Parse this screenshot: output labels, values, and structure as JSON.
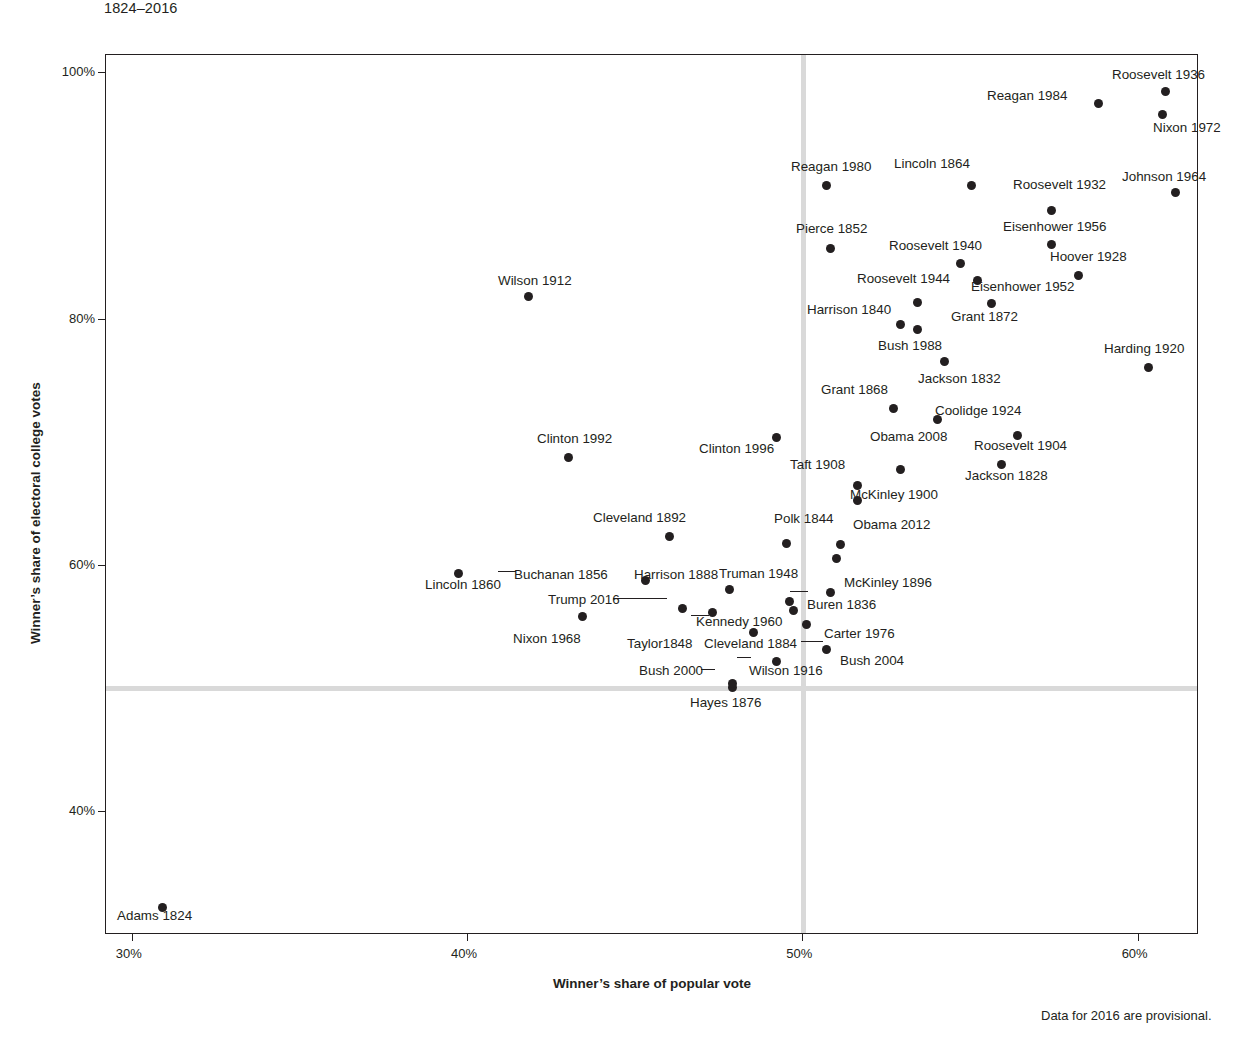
{
  "subtitle": "1824–2016",
  "axis": {
    "x_title": "Winner’s share of popular vote",
    "y_title": "Winner’s share of electoral college votes",
    "x_ticks": [
      "30%",
      "40%",
      "50%",
      "60%"
    ],
    "y_ticks": [
      "100%",
      "80%",
      "60%",
      "40%"
    ]
  },
  "footnote": "Data for 2016 are provisional.",
  "colors": {
    "point": "#231f20",
    "grid": "#d9d9d9",
    "axis": "#231f20",
    "background": "#ffffff"
  },
  "chart_data": {
    "type": "scatter",
    "title": "",
    "subtitle": "1824–2016",
    "xlabel": "Winner’s share of popular vote",
    "ylabel": "Winner’s share of electoral college votes",
    "xlim": [
      29.2,
      61.8
    ],
    "ylim": [
      30.0,
      101.5
    ],
    "grid": false,
    "reference_lines": {
      "x": 50,
      "y": 50
    },
    "note": "Data for 2016 are provisional.",
    "points": [
      {
        "label": "Adams 1824",
        "x": 30.9,
        "y": 32.2
      },
      {
        "label": "Jackson 1828",
        "x": 55.9,
        "y": 68.2
      },
      {
        "label": "Jackson 1832",
        "x": 54.2,
        "y": 76.6
      },
      {
        "label": "Buren 1836",
        "x": 50.8,
        "y": 57.8
      },
      {
        "label": "Harrison 1840",
        "x": 52.9,
        "y": 79.6
      },
      {
        "label": "Polk 1844",
        "x": 49.5,
        "y": 61.8
      },
      {
        "label": "Taylor 1848",
        "x": 47.3,
        "y": 56.2
      },
      {
        "label": "Pierce 1852",
        "x": 50.8,
        "y": 85.8
      },
      {
        "label": "Buchanan 1856",
        "x": 45.3,
        "y": 58.8
      },
      {
        "label": "Lincoln 1860",
        "x": 39.7,
        "y": 59.4
      },
      {
        "label": "Lincoln 1864",
        "x": 55.0,
        "y": 90.9
      },
      {
        "label": "Grant 1868",
        "x": 52.7,
        "y": 72.8
      },
      {
        "label": "Grant 1872",
        "x": 55.6,
        "y": 81.3
      },
      {
        "label": "Hayes 1876",
        "x": 47.9,
        "y": 50.1
      },
      {
        "label": "Cleveland 1884",
        "x": 48.5,
        "y": 54.6
      },
      {
        "label": "Harrison 1888",
        "x": 47.8,
        "y": 58.1
      },
      {
        "label": "Cleveland 1892",
        "x": 46.0,
        "y": 62.4
      },
      {
        "label": "McKinley 1896",
        "x": 51.0,
        "y": 60.6
      },
      {
        "label": "McKinley 1900",
        "x": 51.6,
        "y": 65.3
      },
      {
        "label": "Roosevelt 1904",
        "x": 56.4,
        "y": 70.6
      },
      {
        "label": "Taft 1908",
        "x": 51.6,
        "y": 66.5
      },
      {
        "label": "Wilson 1912",
        "x": 41.8,
        "y": 81.9
      },
      {
        "label": "Wilson 1916",
        "x": 49.2,
        "y": 52.2
      },
      {
        "label": "Harding 1920",
        "x": 60.3,
        "y": 76.1
      },
      {
        "label": "Coolidge 1924",
        "x": 54.0,
        "y": 71.9
      },
      {
        "label": "Hoover 1928",
        "x": 58.2,
        "y": 83.6
      },
      {
        "label": "Roosevelt 1932",
        "x": 57.4,
        "y": 88.9
      },
      {
        "label": "Roosevelt 1936",
        "x": 60.8,
        "y": 98.5
      },
      {
        "label": "Roosevelt 1940",
        "x": 54.7,
        "y": 84.6
      },
      {
        "label": "Roosevelt 1944",
        "x": 53.4,
        "y": 81.4
      },
      {
        "label": "Truman 1948",
        "x": 49.6,
        "y": 57.1
      },
      {
        "label": "Eisenhower 1952",
        "x": 55.2,
        "y": 83.2
      },
      {
        "label": "Eisenhower 1956",
        "x": 57.4,
        "y": 86.1
      },
      {
        "label": "Kennedy 1960",
        "x": 49.7,
        "y": 56.4
      },
      {
        "label": "Johnson 1964",
        "x": 61.1,
        "y": 90.3
      },
      {
        "label": "Nixon 1968",
        "x": 43.4,
        "y": 55.9
      },
      {
        "label": "Nixon 1972",
        "x": 60.7,
        "y": 96.7
      },
      {
        "label": "Carter 1976",
        "x": 50.1,
        "y": 55.2
      },
      {
        "label": "Reagan 1980",
        "x": 50.7,
        "y": 90.9
      },
      {
        "label": "Reagan 1984",
        "x": 58.8,
        "y": 97.6
      },
      {
        "label": "Bush 1988",
        "x": 53.4,
        "y": 79.2
      },
      {
        "label": "Clinton 1992",
        "x": 43.0,
        "y": 68.8
      },
      {
        "label": "Clinton 1996",
        "x": 49.2,
        "y": 70.4
      },
      {
        "label": "Bush 2000",
        "x": 47.9,
        "y": 50.4
      },
      {
        "label": "Bush 2004",
        "x": 50.7,
        "y": 53.2
      },
      {
        "label": "Obama 2008",
        "x": 52.9,
        "y": 67.8
      },
      {
        "label": "Obama 2012",
        "x": 51.1,
        "y": 61.7
      },
      {
        "label": "Trump 2016",
        "x": 46.4,
        "y": 56.5
      }
    ]
  },
  "labels": [
    {
      "name": "Adams 1824",
      "text": "Adams 1824",
      "lx": 116,
      "ly": 908,
      "leader": null
    },
    {
      "name": "Jackson 1828",
      "text": "Jackson 1828",
      "lx": 964,
      "ly": 468,
      "leader": null
    },
    {
      "name": "Jackson 1832",
      "text": "Jackson 1832",
      "lx": 917,
      "ly": 371,
      "leader": null
    },
    {
      "name": "Buren 1836",
      "text": "Buren 1836",
      "lx": 806,
      "ly": 597,
      "leader": {
        "x": 789,
        "y": 590,
        "w": 18
      }
    },
    {
      "name": "Harrison 1840",
      "text": "Harrison 1840",
      "lx": 806,
      "ly": 302,
      "leader": null
    },
    {
      "name": "Polk 1844",
      "text": "Polk 1844",
      "lx": 773,
      "ly": 511,
      "leader": null
    },
    {
      "name": "Taylor 1848",
      "text": "Taylor1848",
      "lx": 626,
      "ly": 636,
      "leader": {
        "x": 690,
        "y": 614,
        "w": 18
      }
    },
    {
      "name": "Pierce 1852",
      "text": "Pierce 1852",
      "lx": 795,
      "ly": 221,
      "leader": null
    },
    {
      "name": "Buchanan 1856",
      "text": "Buchanan 1856",
      "lx": 513,
      "ly": 567,
      "leader": null
    },
    {
      "name": "Lincoln 1860",
      "text": "Lincoln 1860",
      "lx": 424,
      "ly": 577,
      "leader": {
        "x": 497,
        "y": 570,
        "w": 18
      }
    },
    {
      "name": "Lincoln 1864",
      "text": "Lincoln 1864",
      "lx": 893,
      "ly": 156,
      "leader": null
    },
    {
      "name": "Grant 1868",
      "text": "Grant 1868",
      "lx": 820,
      "ly": 382,
      "leader": null
    },
    {
      "name": "Grant 1872",
      "text": "Grant 1872",
      "lx": 950,
      "ly": 309,
      "leader": null
    },
    {
      "name": "Hayes 1876",
      "text": "Hayes 1876",
      "lx": 689,
      "ly": 695,
      "leader": null
    },
    {
      "name": "Cleveland 1884",
      "text": "Cleveland 1884",
      "lx": 703,
      "ly": 636,
      "leader": null
    },
    {
      "name": "Harrison 1888",
      "text": "Harrison 1888",
      "lx": 633,
      "ly": 567,
      "leader": null
    },
    {
      "name": "Cleveland 1892",
      "text": "Cleveland 1892",
      "lx": 592,
      "ly": 510,
      "leader": null
    },
    {
      "name": "McKinley 1896",
      "text": "McKinley 1896",
      "lx": 843,
      "ly": 575,
      "leader": null
    },
    {
      "name": "McKinley 1900",
      "text": "McKinley 1900",
      "lx": 849,
      "ly": 487,
      "leader": null
    },
    {
      "name": "Roosevelt 1904",
      "text": "Roosevelt 1904",
      "lx": 973,
      "ly": 438,
      "leader": null
    },
    {
      "name": "Taft 1908",
      "text": "Taft 1908",
      "lx": 789,
      "ly": 457,
      "leader": null
    },
    {
      "name": "Wilson 1912",
      "text": "Wilson 1912",
      "lx": 497,
      "ly": 273,
      "leader": null
    },
    {
      "name": "Wilson 1916",
      "text": "Wilson 1916",
      "lx": 748,
      "ly": 663,
      "leader": {
        "x": 736,
        "y": 656,
        "w": 14
      }
    },
    {
      "name": "Harding 1920",
      "text": "Harding 1920",
      "lx": 1103,
      "ly": 341,
      "leader": null
    },
    {
      "name": "Coolidge 1924",
      "text": "Coolidge 1924",
      "lx": 934,
      "ly": 403,
      "leader": null
    },
    {
      "name": "Hoover 1928",
      "text": "Hoover 1928",
      "lx": 1049,
      "ly": 249,
      "leader": null
    },
    {
      "name": "Roosevelt 1932",
      "text": "Roosevelt 1932",
      "lx": 1012,
      "ly": 177,
      "leader": null
    },
    {
      "name": "Roosevelt 1936",
      "text": "Roosevelt 1936",
      "lx": 1111,
      "ly": 67,
      "leader": null
    },
    {
      "name": "Roosevelt 1940",
      "text": "Roosevelt 1940",
      "lx": 888,
      "ly": 238,
      "leader": null
    },
    {
      "name": "Roosevelt 1944",
      "text": "Roosevelt 1944",
      "lx": 856,
      "ly": 271,
      "leader": null
    },
    {
      "name": "Truman 1948",
      "text": "Truman 1948",
      "lx": 718,
      "ly": 566,
      "leader": null
    },
    {
      "name": "Eisenhower 1952",
      "text": "Eisenhower 1952",
      "lx": 970,
      "ly": 279,
      "leader": null
    },
    {
      "name": "Eisenhower 1956",
      "text": "Eisenhower 1956",
      "lx": 1002,
      "ly": 219,
      "leader": null
    },
    {
      "name": "Kennedy 1960",
      "text": "Kennedy 1960",
      "lx": 695,
      "ly": 614,
      "leader": null
    },
    {
      "name": "Johnson 1964",
      "text": "Johnson 1964",
      "lx": 1121,
      "ly": 169,
      "leader": null
    },
    {
      "name": "Nixon 1968",
      "text": "Nixon 1968",
      "lx": 512,
      "ly": 631,
      "leader": null
    },
    {
      "name": "Nixon 1972",
      "text": "Nixon 1972",
      "lx": 1152,
      "ly": 120,
      "leader": null
    },
    {
      "name": "Carter 1976",
      "text": "Carter 1976",
      "lx": 823,
      "ly": 626,
      "leader": {
        "x": 800,
        "y": 640,
        "w": 22
      }
    },
    {
      "name": "Reagan 1980",
      "text": "Reagan 1980",
      "lx": 790,
      "ly": 159,
      "leader": null
    },
    {
      "name": "Reagan 1984",
      "text": "Reagan 1984",
      "lx": 986,
      "ly": 88,
      "leader": null
    },
    {
      "name": "Bush 1988",
      "text": "Bush 1988",
      "lx": 877,
      "ly": 338,
      "leader": null
    },
    {
      "name": "Clinton 1992",
      "text": "Clinton 1992",
      "lx": 536,
      "ly": 431,
      "leader": null
    },
    {
      "name": "Clinton 1996",
      "text": "Clinton 1996",
      "lx": 698,
      "ly": 441,
      "leader": null
    },
    {
      "name": "Bush 2000",
      "text": "Bush 2000",
      "lx": 638,
      "ly": 663,
      "leader": {
        "x": 700,
        "y": 668,
        "w": 14
      }
    },
    {
      "name": "Bush 2004",
      "text": "Bush 2004",
      "lx": 839,
      "ly": 653,
      "leader": null
    },
    {
      "name": "Obama 2008",
      "text": "Obama 2008",
      "lx": 869,
      "ly": 429,
      "leader": null
    },
    {
      "name": "Obama 2012",
      "text": "Obama 2012",
      "lx": 852,
      "ly": 517,
      "leader": null
    },
    {
      "name": "Trump 2016",
      "text": "Trump 2016",
      "lx": 547,
      "ly": 592,
      "leader": {
        "x": 612,
        "y": 597,
        "w": 54
      }
    }
  ]
}
